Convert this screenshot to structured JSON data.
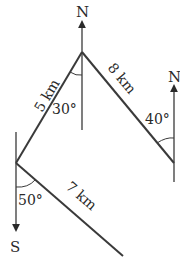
{
  "diagram": {
    "type": "bearing-path",
    "colors": {
      "line": "#3a3a3a",
      "text": "#2a2a2a",
      "background": "#ffffff"
    },
    "points": {
      "start": {
        "x": 16,
        "y": 163
      },
      "top": {
        "x": 82,
        "y": 52
      },
      "right": {
        "x": 174,
        "y": 163
      },
      "end": {
        "x": 123,
        "y": 256
      }
    },
    "labels": {
      "north_top": "N",
      "north_right": "N",
      "south_left": "S",
      "leg1": "5 km",
      "leg2": "8 km",
      "leg3": "7 km",
      "angle_top": "30°",
      "angle_right": "40°",
      "angle_left": "50°"
    },
    "legs": [
      {
        "from": "start",
        "to": "top",
        "distance": "5 km"
      },
      {
        "from": "top",
        "to": "right",
        "distance": "8 km"
      },
      {
        "from": "start",
        "to": "end",
        "distance": "7 km"
      }
    ],
    "angles": [
      {
        "at": "top",
        "value": "30°",
        "reference": "N"
      },
      {
        "at": "right",
        "value": "40°",
        "reference": "N"
      },
      {
        "at": "start",
        "value": "50°",
        "reference": "S"
      }
    ]
  }
}
